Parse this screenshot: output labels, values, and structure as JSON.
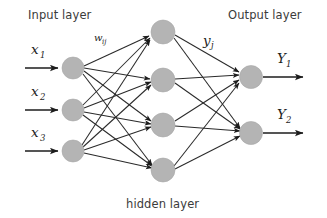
{
  "diagram": {
    "type": "neural-network-architecture",
    "background_color": "#ffffff",
    "node_color": "#b4b4b4",
    "edge_color": "#2a2a2a",
    "text_color": "#3b3b3b",
    "labels": {
      "input_layer": "Input layer",
      "hidden_layer": "hidden layer",
      "output_layer": "Output layer",
      "weight_symbol": "w",
      "weight_subscript": "ij",
      "activation_symbol": "y",
      "activation_subscript": "j"
    },
    "layers": {
      "input": {
        "count": 3,
        "nodes": [
          {
            "symbol": "x",
            "subscript": "1",
            "cx": 73,
            "cy": 68
          },
          {
            "symbol": "x",
            "subscript": "2",
            "cx": 73,
            "cy": 110
          },
          {
            "symbol": "x",
            "subscript": "3",
            "cx": 73,
            "cy": 151
          }
        ]
      },
      "hidden": {
        "count": 4,
        "nodes": [
          {
            "cx": 163,
            "cy": 32
          },
          {
            "cx": 163,
            "cy": 80
          },
          {
            "cx": 163,
            "cy": 125
          },
          {
            "cx": 163,
            "cy": 170
          }
        ]
      },
      "output": {
        "count": 2,
        "nodes": [
          {
            "symbol": "Y",
            "subscript": "1",
            "cx": 251,
            "cy": 77
          },
          {
            "symbol": "Y",
            "subscript": "2",
            "cx": 251,
            "cy": 133
          }
        ]
      }
    },
    "node_radius": {
      "input": 11,
      "hidden": 12,
      "output": 11.5
    },
    "connections": {
      "input_to_hidden": "fully-connected",
      "input_to_hidden_count": 12,
      "hidden_to_output": "fully-connected",
      "hidden_to_output_count": 8
    }
  }
}
